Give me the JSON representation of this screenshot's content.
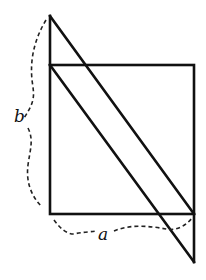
{
  "diagram": {
    "labels": {
      "b": "b",
      "a": "a"
    },
    "colors": {
      "stroke": "#111111",
      "background": "#ffffff"
    }
  }
}
